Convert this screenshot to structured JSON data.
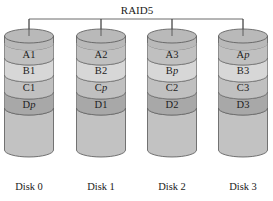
{
  "title": "RAID5",
  "colors": {
    "top": "#b9b9b9",
    "band_a": "#c0c0c0",
    "band_b": "#d7d7d7",
    "band_c": "#c0c0c0",
    "band_d": "#a8a8a8",
    "body": "#c2c2c2",
    "stroke": "#555555"
  },
  "disks": [
    {
      "label": "Disk 0",
      "blocks": [
        {
          "name": "A",
          "suffix": "1"
        },
        {
          "name": "B",
          "suffix": "1"
        },
        {
          "name": "C",
          "suffix": "1"
        },
        {
          "name": "D",
          "suffix": "p"
        }
      ]
    },
    {
      "label": "Disk 1",
      "blocks": [
        {
          "name": "A",
          "suffix": "2"
        },
        {
          "name": "B",
          "suffix": "2"
        },
        {
          "name": "C",
          "suffix": "p"
        },
        {
          "name": "D",
          "suffix": "1"
        }
      ]
    },
    {
      "label": "Disk 2",
      "blocks": [
        {
          "name": "A",
          "suffix": "3"
        },
        {
          "name": "B",
          "suffix": "p"
        },
        {
          "name": "C",
          "suffix": "2"
        },
        {
          "name": "D",
          "suffix": "2"
        }
      ]
    },
    {
      "label": "Disk 3",
      "blocks": [
        {
          "name": "A",
          "suffix": "p"
        },
        {
          "name": "B",
          "suffix": "3"
        },
        {
          "name": "C",
          "suffix": "3"
        },
        {
          "name": "D",
          "suffix": "3"
        }
      ]
    }
  ]
}
